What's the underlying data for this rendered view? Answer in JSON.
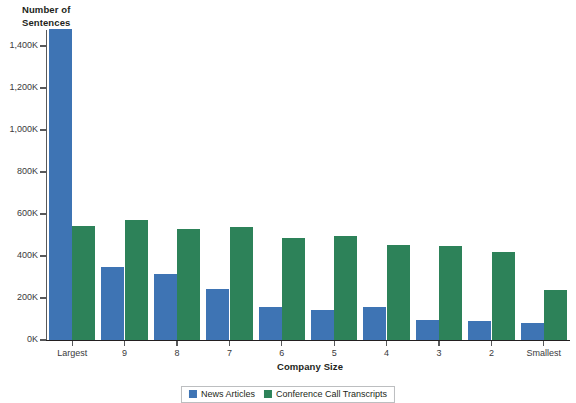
{
  "chart_data": {
    "type": "bar",
    "title": "",
    "ylabel": "Number of\nSentences",
    "xlabel": "Company Size",
    "categories": [
      "Largest",
      "9",
      "8",
      "7",
      "6",
      "5",
      "4",
      "3",
      "2",
      "Smallest"
    ],
    "series": [
      {
        "name": "News Articles",
        "color": "#3e74b4",
        "values": [
          1480,
          348,
          315,
          243,
          155,
          142,
          158,
          95,
          92,
          80
        ]
      },
      {
        "name": "Conference Call Transcripts",
        "color": "#2d8259",
        "values": [
          543,
          572,
          527,
          540,
          485,
          495,
          453,
          448,
          420,
          236
        ]
      }
    ],
    "yticks": [
      "0K",
      "200K",
      "400K",
      "600K",
      "800K",
      "1,000K",
      "1,200K",
      "1,400K"
    ],
    "ytick_values": [
      0,
      200,
      400,
      600,
      800,
      1000,
      1200,
      1400
    ],
    "ylim": [
      0,
      1490
    ],
    "grid": false,
    "legend_position": "bottom",
    "units": "thousands of sentences"
  }
}
